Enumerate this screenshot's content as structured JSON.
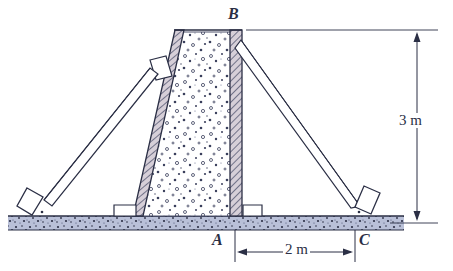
{
  "figure": {
    "type": "engineering-diagram",
    "labels": {
      "point_b": "B",
      "point_a": "A",
      "point_c": "C"
    },
    "dimensions": {
      "height": "3 m",
      "base_span": "2 m"
    },
    "colors": {
      "ink": "#2b2f45",
      "line": "#3a3f5c",
      "ground_fill": "#b9c0d8",
      "hatch_fill": "#cfc8d2",
      "concrete_fill": "#ffffff",
      "speckle": "#3a3f5c",
      "shoe_fill": "#ffffff"
    },
    "parts": {
      "left_form_panel": "left-form-panel",
      "concrete_fill": "concrete-fill",
      "right_form_panel": "right-form-panel",
      "left_brace": "left-brace",
      "right_brace": "right-brace",
      "left_shoe": "left-shoe",
      "right_shoe": "right-shoe",
      "left_bracket": "left-brace-bracket",
      "left_base_cleat": "left-base-cleat",
      "right_base_cleat": "right-base-cleat",
      "ground": "ground-strip"
    },
    "geometry": {
      "ground_y": 216,
      "top_y": 30,
      "wall_base_left_x": 137,
      "wall_base_right_x": 235,
      "wall_top_left_x": 182,
      "wall_top_right_x": 235,
      "point_c_x": 355,
      "left_shoe_x": 38,
      "dim_line_x": 417,
      "dim_line_y": 248
    }
  }
}
